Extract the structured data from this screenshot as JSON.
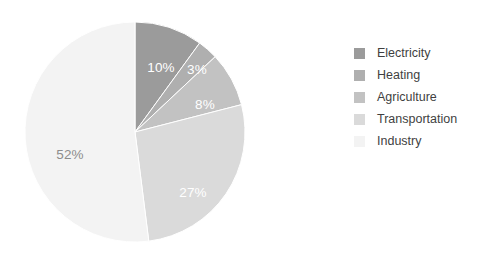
{
  "canvas": {
    "width": 499,
    "height": 262,
    "background": "#ffffff"
  },
  "chart_data": {
    "type": "pie",
    "title": "",
    "subtitle": "",
    "xlabel": "",
    "ylabel": "",
    "grid": false,
    "legend_position": "right",
    "start_angle_deg": 0,
    "direction": "clockwise",
    "center": {
      "x": 135,
      "y": 132
    },
    "radius": 110,
    "unit": "%",
    "categories": [
      "Electricity",
      "Heating",
      "Agriculture",
      "Transportation",
      "Industry"
    ],
    "values": [
      10,
      3,
      8,
      27,
      52
    ],
    "data_labels": [
      "10%",
      "3%",
      "8%",
      "27%",
      "52%"
    ],
    "colors": [
      "#9b9b9b",
      "#afafaf",
      "#c2c2c2",
      "#dadada",
      "#f3f3f3"
    ],
    "label_colors": [
      "#ffffff",
      "#ffffff",
      "#ffffff",
      "#ffffff",
      "#8c8c8c"
    ],
    "slices": [
      {
        "name": "Electricity",
        "value": 10,
        "label": "10%",
        "color": "#9b9b9b",
        "label_color": "#ffffff",
        "label_x": 161,
        "label_y": 68
      },
      {
        "name": "Heating",
        "value": 3,
        "label": "3%",
        "color": "#afafaf",
        "label_color": "#ffffff",
        "label_x": 197,
        "label_y": 70
      },
      {
        "name": "Agriculture",
        "value": 8,
        "label": "8%",
        "color": "#c2c2c2",
        "label_color": "#ffffff",
        "label_x": 205,
        "label_y": 105
      },
      {
        "name": "Transportation",
        "value": 27,
        "label": "27%",
        "color": "#dadada",
        "label_color": "#ffffff",
        "label_x": 193,
        "label_y": 193
      },
      {
        "name": "Industry",
        "value": 52,
        "label": "52%",
        "color": "#f3f3f3",
        "label_color": "#8c8c8c",
        "label_x": 70,
        "label_y": 155
      }
    ]
  },
  "legend": {
    "items": [
      {
        "label": "Electricity",
        "color": "#9b9b9b"
      },
      {
        "label": "Heating",
        "color": "#afafaf"
      },
      {
        "label": "Agriculture",
        "color": "#c2c2c2"
      },
      {
        "label": "Transportation",
        "color": "#dadada"
      },
      {
        "label": "Industry",
        "color": "#f3f3f3"
      }
    ]
  }
}
